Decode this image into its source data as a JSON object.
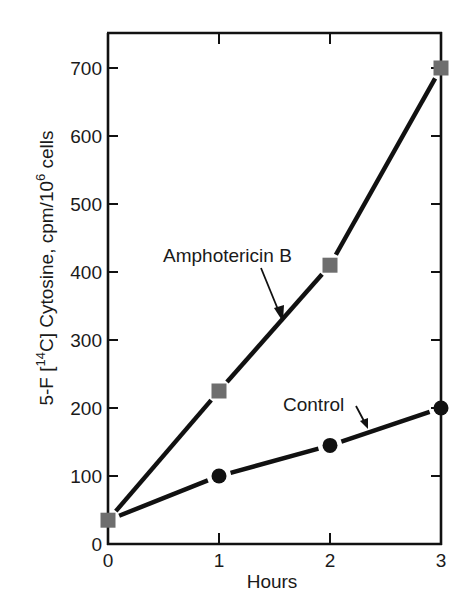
{
  "chart_data": {
    "type": "line",
    "title": "",
    "xlabel": "Hours",
    "ylabel": "5-F [14C] Cytosine, cpm/10^6 cells",
    "ylabel_parts": {
      "prefix": "5-F [",
      "sup1": "14",
      "middle": "C] Cytosine, cpm/10",
      "sup2": "6",
      "suffix": " cells"
    },
    "x": [
      0,
      1,
      2,
      3
    ],
    "x_ticks": [
      "0",
      "1",
      "2",
      "3"
    ],
    "y_ticks": [
      "0",
      "100",
      "200",
      "300",
      "400",
      "500",
      "600",
      "700"
    ],
    "xlim": [
      0,
      3
    ],
    "ylim": [
      0,
      750
    ],
    "grid": false,
    "legend": "none (inline annotations with arrows)",
    "series": [
      {
        "name": "Amphotericin B",
        "marker": "square",
        "marker_color": "#6e6e6e",
        "line_color": "#111111",
        "values": [
          35,
          225,
          410,
          700
        ]
      },
      {
        "name": "Control",
        "marker": "circle",
        "marker_color": "#111111",
        "line_color": "#111111",
        "values": [
          35,
          100,
          145,
          200
        ]
      }
    ],
    "annotations": [
      {
        "text": "Amphotericin B",
        "points_to_series": "Amphotericin B"
      },
      {
        "text": "Control",
        "points_to_series": "Control"
      }
    ]
  }
}
